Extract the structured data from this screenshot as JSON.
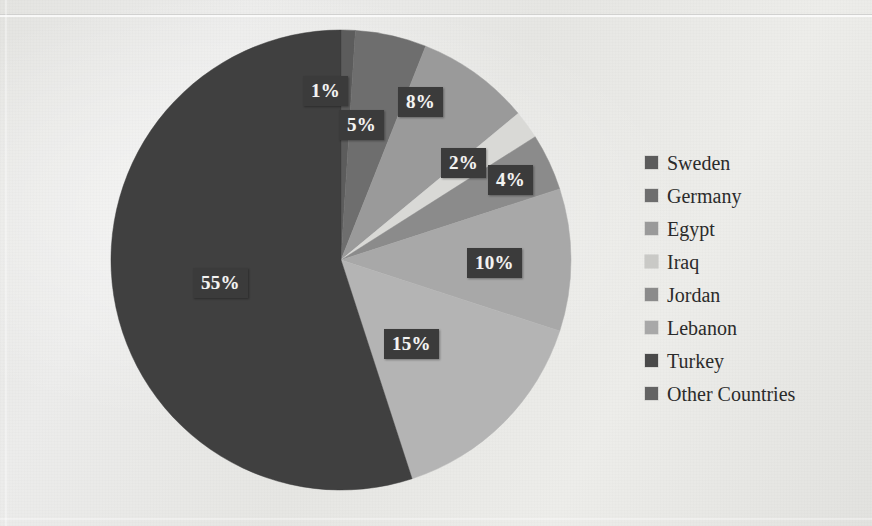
{
  "chart_data": {
    "type": "pie",
    "title": "",
    "subtitle": "",
    "xlabel": "",
    "ylabel": "",
    "grid": false,
    "legend_position": "right",
    "unit": "%",
    "categories": [
      "Sweden",
      "Germany",
      "Egypt",
      "Iraq",
      "Jordan",
      "Lebanon",
      "Turkey",
      "Other Countries"
    ],
    "values": [
      1,
      5,
      8,
      2,
      4,
      10,
      15,
      55
    ],
    "value_labels": [
      "1%",
      "5%",
      "8%",
      "2%",
      "4%",
      "10%",
      "15%",
      "55%"
    ],
    "colors": [
      "#5c5c5c",
      "#6e6e6e",
      "#9a9a9a",
      "#d9d9d6",
      "#8b8b8b",
      "#a8a8a8",
      "#b4b4b4",
      "#3f3f3f"
    ],
    "start_angle_deg": 0,
    "direction": "clockwise",
    "slices": [
      {
        "name": "Sweden",
        "value": 1,
        "label": "1%",
        "color": "#5c5c5c"
      },
      {
        "name": "Germany",
        "value": 5,
        "label": "5%",
        "color": "#6e6e6e"
      },
      {
        "name": "Egypt",
        "value": 8,
        "label": "8%",
        "color": "#9a9a9a"
      },
      {
        "name": "Iraq",
        "value": 2,
        "label": "2%",
        "color": "#d9d9d6"
      },
      {
        "name": "Jordan",
        "value": 4,
        "label": "4%",
        "color": "#8b8b8b"
      },
      {
        "name": "Lebanon",
        "value": 10,
        "label": "10%",
        "color": "#a8a8a8"
      },
      {
        "name": "Turkey",
        "value": 15,
        "label": "15%",
        "color": "#b4b4b4"
      },
      {
        "name": "Other Countries",
        "value": 55,
        "label": "55%",
        "color": "#3f3f3f"
      }
    ]
  },
  "labels": {
    "sweden": "1%",
    "germany": "5%",
    "egypt": "8%",
    "iraq": "2%",
    "jordan": "4%",
    "lebanon": "10%",
    "turkey": "15%",
    "other": "55%"
  },
  "legend": {
    "items": [
      {
        "label": "Sweden",
        "color": "#5c5c5c"
      },
      {
        "label": "Germany",
        "color": "#6e6e6e"
      },
      {
        "label": "Egypt",
        "color": "#9a9a9a"
      },
      {
        "label": "Iraq",
        "color": "#c9c9c6"
      },
      {
        "label": "Jordan",
        "color": "#8b8b8b"
      },
      {
        "label": "Lebanon",
        "color": "#a8a8a8"
      },
      {
        "label": "Turkey",
        "color": "#4a4a4a"
      },
      {
        "label": "Other Countries",
        "color": "#636363"
      }
    ]
  },
  "theme": {
    "background": "#e8e8e6",
    "label_box": "#3b3b3b",
    "label_text": "#f4f4f2",
    "legend_text": "#2b2b2b"
  }
}
